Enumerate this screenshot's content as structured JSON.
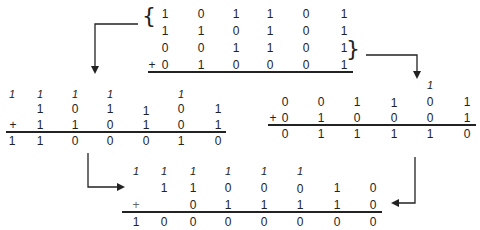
{
  "top_block": {
    "rows": [
      [
        "1",
        "0",
        "1",
        "1",
        "0",
        "1"
      ],
      [
        "1",
        "1",
        "0",
        "1",
        "0",
        "1"
      ],
      [
        "0",
        "0",
        "1",
        "1",
        "0",
        "1"
      ],
      [
        "0",
        "1",
        "0",
        "0",
        "0",
        "1"
      ]
    ],
    "plus": "+",
    "brace_open": "{",
    "brace_close": "}"
  },
  "left_block": {
    "carries": [
      "1",
      "1",
      "1",
      "1",
      "",
      "1",
      ""
    ],
    "row1": [
      "",
      "1",
      "0",
      "1",
      "1",
      "0",
      "1"
    ],
    "row2": [
      "",
      "1",
      "1",
      "0",
      "1",
      "0",
      "1"
    ],
    "result": [
      "1",
      "1",
      "0",
      "0",
      "0",
      "1",
      "0"
    ],
    "plus": "+"
  },
  "right_block": {
    "carries": [
      "",
      "",
      "",
      "",
      "1",
      ""
    ],
    "row1": [
      "0",
      "0",
      "1",
      "1",
      "0",
      "1"
    ],
    "row2": [
      "0",
      "1",
      "0",
      "0",
      "0",
      "1"
    ],
    "result": [
      "0",
      "1",
      "1",
      "1",
      "1",
      "0"
    ],
    "plus": "+"
  },
  "bottom_block": {
    "carries": [
      "",
      "1",
      "1",
      "1",
      "1",
      "1",
      "1",
      "",
      ""
    ],
    "row1": [
      "",
      "",
      "1",
      "1",
      "0",
      "0",
      "0",
      "1",
      "0"
    ],
    "row2": [
      "",
      "",
      "0",
      "1",
      "1",
      "1",
      "1",
      "0"
    ],
    "result": [
      "1",
      "0",
      "0",
      "0",
      "0",
      "0",
      "0",
      "0"
    ],
    "plus": "+"
  }
}
